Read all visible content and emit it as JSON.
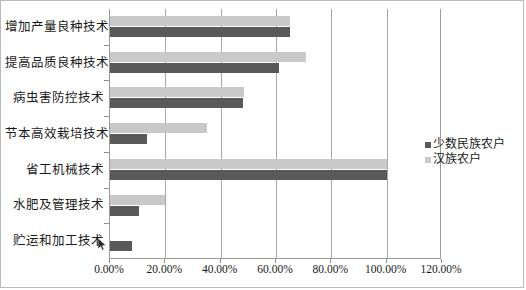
{
  "chart_data": {
    "type": "bar",
    "orientation": "horizontal",
    "title": "",
    "xlabel": "",
    "ylabel": "",
    "xlim": [
      0,
      120
    ],
    "xtick_labels": [
      "0.00%",
      "20.00%",
      "40.00%",
      "60.00%",
      "80.00%",
      "100.00%",
      "120.00%"
    ],
    "xticks": [
      0,
      20,
      40,
      60,
      80,
      100,
      120
    ],
    "grid": true,
    "grid_axis": "x",
    "legend_position": "right",
    "categories": [
      "增加产量良种技术",
      "提高品质良种技术",
      "病虫害防控技术",
      "节本高效栽培技术",
      "省工机械技术",
      "水肥及管理技术",
      "贮运和加工技术"
    ],
    "series": [
      {
        "name": "少数民族农户",
        "color": "#595959",
        "values": [
          65.0,
          61.0,
          48.0,
          13.5,
          100.0,
          10.5,
          8.0
        ]
      },
      {
        "name": "汉族农户",
        "color": "#c9c9c9",
        "values": [
          65.0,
          71.0,
          48.5,
          35.0,
          100.0,
          20.0,
          0.0
        ]
      }
    ]
  },
  "legend": {
    "items": [
      {
        "label": "少数民族农户",
        "color": "#595959"
      },
      {
        "label": "汉族农户",
        "color": "#c9c9c9"
      }
    ]
  },
  "colors": {
    "series_dark": "#595959",
    "series_light": "#c9c9c9",
    "gridline": "#a7a7a7",
    "axis": "#9a9a9a",
    "frame_border": "#b9b9b9",
    "text": "#1a1a1a",
    "background": "#ffffff"
  }
}
